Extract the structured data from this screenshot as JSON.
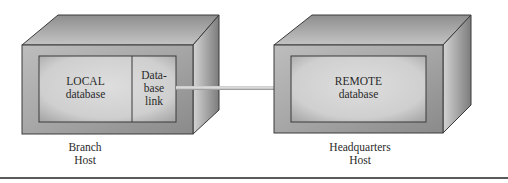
{
  "diagram": {
    "type": "distributed-database-link",
    "hosts": [
      {
        "id": "branch",
        "label_line1": "Branch",
        "label_line2": "Host",
        "database": {
          "line1": "LOCAL",
          "line2": "database"
        },
        "link_component": {
          "line1": "Data-",
          "line2": "base",
          "line3": "link"
        }
      },
      {
        "id": "headquarters",
        "label_line1": "Headquarters",
        "label_line2": "Host",
        "database": {
          "line1": "REMOTE",
          "line2": "database"
        }
      }
    ],
    "connection": {
      "from": "Database link",
      "to": "REMOTE database"
    },
    "colors": {
      "box_outline": "#3a3a3a",
      "box_face": "#a8a8a8",
      "inner_panel": "#d0d0d0",
      "link_bar": "#b0b0b0",
      "rule": "#5a5a5a"
    }
  }
}
